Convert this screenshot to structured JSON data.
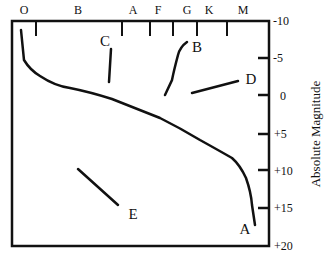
{
  "diagram": {
    "spectral_classes": [
      "O",
      "B",
      "A",
      "F",
      "G",
      "K",
      "M"
    ],
    "y_axis": {
      "label": "Absolute Magnitude",
      "ticks": [
        "-10",
        "-5",
        "0",
        "+5",
        "+10",
        "+15",
        "+20"
      ]
    },
    "regions": [
      {
        "id": "A",
        "label": "A"
      },
      {
        "id": "B",
        "label": "B"
      },
      {
        "id": "C",
        "label": "C"
      },
      {
        "id": "D",
        "label": "D"
      },
      {
        "id": "E",
        "label": "E"
      }
    ]
  }
}
